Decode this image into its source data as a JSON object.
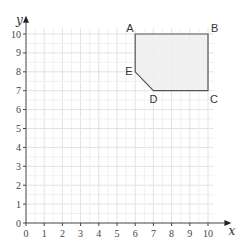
{
  "diagram": {
    "type": "coordinate-grid",
    "x_axis": {
      "label": "x",
      "min": 0,
      "max": 10,
      "ticks": [
        "0",
        "1",
        "2",
        "3",
        "4",
        "5",
        "6",
        "7",
        "8",
        "9",
        "10"
      ]
    },
    "y_axis": {
      "label": "y",
      "min": 0,
      "max": 10,
      "ticks": [
        "0",
        "1",
        "2",
        "3",
        "4",
        "5",
        "6",
        "7",
        "8",
        "9",
        "10"
      ]
    },
    "shape": {
      "fill": "#efefef",
      "stroke": "#555555",
      "vertices": [
        {
          "name": "A",
          "x": 6,
          "y": 10
        },
        {
          "name": "B",
          "x": 10,
          "y": 10
        },
        {
          "name": "C",
          "x": 10,
          "y": 7
        },
        {
          "name": "D",
          "x": 7,
          "y": 7
        },
        {
          "name": "E",
          "x": 6,
          "y": 8
        }
      ]
    },
    "grid_color": "#e6e6e6",
    "axis_color": "#444444"
  }
}
